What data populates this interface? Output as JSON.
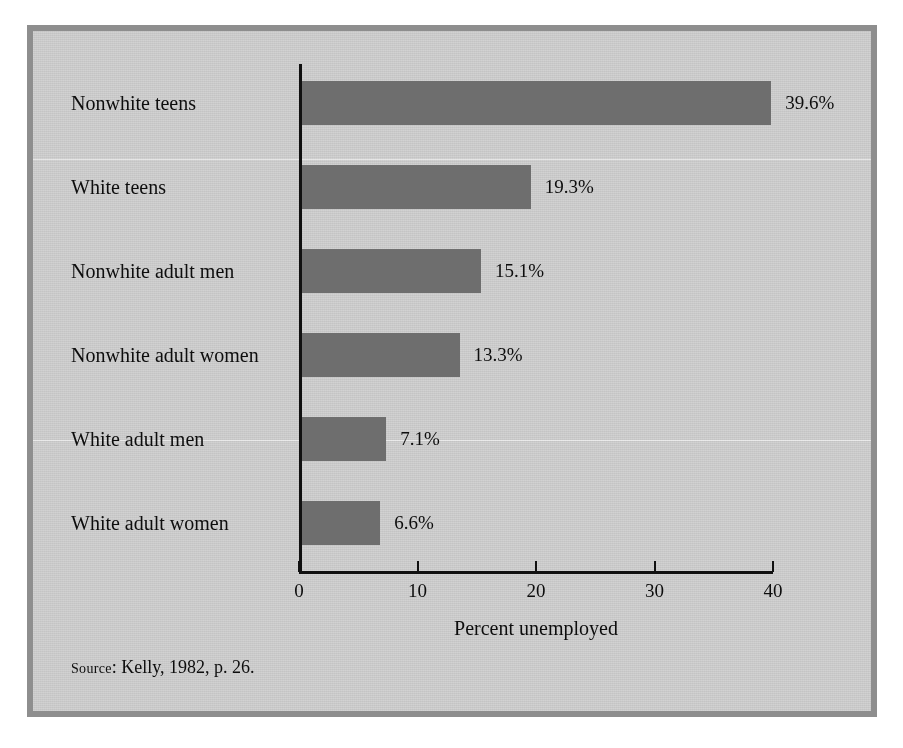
{
  "figure": {
    "source_note_prefix": "Source",
    "source_note_separator": ":",
    "source_note_text": "Kelly, 1982, p. 26.",
    "frame_color": "#8e8e8e",
    "background_color": "#d2d2d2",
    "bar_color": "#6e6e6e",
    "axis_color": "#111111"
  },
  "chart_data": {
    "type": "bar",
    "orientation": "horizontal",
    "title": "",
    "subtitle": "",
    "xlabel": "Percent unemployed",
    "ylabel": "",
    "xlim": [
      0,
      40
    ],
    "ylim": null,
    "grid": false,
    "legend": null,
    "xticks": [
      0,
      10,
      20,
      30,
      40
    ],
    "xticklabels": [
      "0",
      "10",
      "20",
      "30",
      "40"
    ],
    "categories": [
      "Nonwhite teens",
      "White teens",
      "Nonwhite adult men",
      "Nonwhite adult women",
      "White adult men",
      "White adult women"
    ],
    "values": [
      39.6,
      19.3,
      15.1,
      13.3,
      7.1,
      6.6
    ],
    "value_labels": [
      "39.6%",
      "19.3%",
      "15.1%",
      "13.3%",
      "7.1%",
      "6.6%"
    ],
    "series": [
      {
        "name": "Percent unemployed",
        "values": [
          39.6,
          19.3,
          15.1,
          13.3,
          7.1,
          6.6
        ]
      }
    ],
    "annotations": []
  }
}
